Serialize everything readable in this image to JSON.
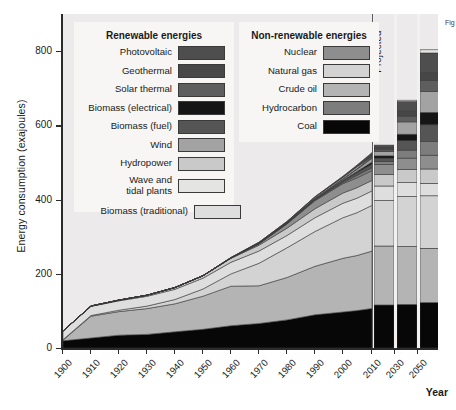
{
  "figure": {
    "y_axis_title": "Energy consumption (exajoules)",
    "x_axis_title": "Year",
    "projected_label": "Projected",
    "caption_fragment": "Fig"
  },
  "legends": [
    {
      "id": "renewable",
      "title": "Renewable energies",
      "items": [
        {
          "label": "Photovoltaic",
          "color": "#4e4e4e"
        },
        {
          "label": "Geothermal",
          "color": "#474747"
        },
        {
          "label": "Solar thermal",
          "color": "#5e5e5e"
        },
        {
          "label": "Biomass (electrical)",
          "color": "#151515"
        },
        {
          "label": "Biomass (fuel)",
          "color": "#555555"
        },
        {
          "label": "Wind",
          "color": "#a3a3a3"
        },
        {
          "label": "Hydropower",
          "color": "#c9c9c9"
        },
        {
          "label": "Wave and\ntidal plants",
          "color": "#e4e4e2"
        },
        {
          "label": "Biomass (traditional)",
          "color": "#dedede"
        }
      ]
    },
    {
      "id": "nonrenewable",
      "title": "Non-renewable energies",
      "items": [
        {
          "label": "Nuclear",
          "color": "#8e8e8e"
        },
        {
          "label": "Natural gas",
          "color": "#d3d3d3"
        },
        {
          "label": "Crude oil",
          "color": "#b4b4b4"
        },
        {
          "label": "Hydrocarbon",
          "color": "#7d7d7d"
        },
        {
          "label": "Coal",
          "color": "#070707"
        }
      ]
    }
  ],
  "chart_data": {
    "type": "area",
    "title": "",
    "xlabel": "Year",
    "ylabel": "Energy consumption (exajoules)",
    "xlim": [
      1900,
      2055
    ],
    "ylim": [
      0,
      900
    ],
    "yticks": [
      0,
      200,
      400,
      600,
      800
    ],
    "xticks": [
      1900,
      1910,
      1920,
      1930,
      1940,
      1950,
      1960,
      1970,
      1980,
      1990,
      2000,
      2010,
      2030,
      2050
    ],
    "grid": false,
    "legend_position": "inside-top",
    "annotations": [
      {
        "text": "Projected",
        "x": 2005,
        "orientation": "vertical"
      }
    ],
    "historic_x": [
      1900,
      1910,
      1920,
      1930,
      1940,
      1950,
      1960,
      1970,
      1980,
      1990,
      2000,
      2005
    ],
    "projected_x": [
      2010,
      2020,
      2030,
      2040,
      2050
    ],
    "stack_order_bottom_to_top": [
      "Coal",
      "Crude oil",
      "Natural gas",
      "Biomass (traditional)",
      "Hydropower",
      "Nuclear",
      "Hydrocarbon",
      "Biomass (fuel)",
      "Biomass (electrical)",
      "Wind",
      "Solar thermal",
      "Geothermal",
      "Photovoltaic",
      "Wave and tidal plants"
    ],
    "series": [
      {
        "name": "Coal",
        "color": "#070707",
        "values": [
          20,
          28,
          36,
          38,
          45,
          52,
          62,
          68,
          78,
          92,
          100,
          104,
          110,
          120,
          125,
          120,
          110
        ]
      },
      {
        "name": "Crude oil",
        "color": "#b4b4b4",
        "values": [
          2,
          5,
          10,
          16,
          22,
          36,
          62,
          110,
          128,
          134,
          148,
          152,
          158,
          160,
          150,
          130,
          105
        ]
      },
      {
        "name": "Natural gas",
        "color": "#d3d3d3",
        "values": [
          1,
          2,
          4,
          7,
          12,
          20,
          34,
          62,
          82,
          96,
          112,
          118,
          126,
          138,
          145,
          140,
          128
        ]
      },
      {
        "name": "Biomass (traditional)",
        "color": "#dedede",
        "values": [
          24,
          25,
          26,
          27,
          28,
          30,
          32,
          34,
          36,
          38,
          40,
          40,
          40,
          38,
          34,
          30,
          26
        ]
      },
      {
        "name": "Hydropower",
        "color": "#c9c9c9",
        "values": [
          0,
          1,
          2,
          3,
          5,
          7,
          11,
          16,
          20,
          24,
          28,
          29,
          31,
          36,
          40,
          44,
          48
        ]
      },
      {
        "name": "Nuclear",
        "color": "#8e8e8e",
        "values": [
          0,
          0,
          0,
          0,
          0,
          0,
          1,
          4,
          12,
          22,
          26,
          27,
          28,
          32,
          38,
          44,
          50
        ]
      },
      {
        "name": "Hydrocarbon",
        "color": "#7d7d7d",
        "values": [
          0,
          0,
          0,
          0,
          0,
          0,
          0,
          0,
          1,
          2,
          3,
          4,
          8,
          22,
          38,
          52,
          62
        ]
      },
      {
        "name": "Biomass (fuel)",
        "color": "#555555",
        "values": [
          0,
          0,
          0,
          0,
          0,
          0,
          0,
          0,
          1,
          2,
          4,
          5,
          10,
          26,
          46,
          66,
          86
        ]
      },
      {
        "name": "Biomass (electrical)",
        "color": "#151515",
        "values": [
          0,
          0,
          0,
          0,
          0,
          0,
          0,
          0,
          0,
          1,
          2,
          3,
          6,
          18,
          34,
          52,
          70
        ]
      },
      {
        "name": "Wind",
        "color": "#a3a3a3",
        "values": [
          0,
          0,
          0,
          0,
          0,
          0,
          0,
          0,
          0,
          1,
          3,
          5,
          12,
          34,
          58,
          82,
          104
        ]
      },
      {
        "name": "Solar thermal",
        "color": "#5e5e5e",
        "values": [
          0,
          0,
          0,
          0,
          0,
          0,
          0,
          0,
          0,
          0,
          1,
          2,
          5,
          16,
          30,
          46,
          60
        ]
      },
      {
        "name": "Geothermal",
        "color": "#474747",
        "values": [
          0,
          0,
          0,
          0,
          0,
          0,
          0,
          1,
          1,
          2,
          3,
          4,
          7,
          14,
          22,
          30,
          38
        ]
      },
      {
        "name": "Photovoltaic",
        "color": "#4e4e4e",
        "values": [
          0,
          0,
          0,
          0,
          0,
          0,
          0,
          0,
          0,
          0,
          1,
          2,
          6,
          26,
          54,
          86,
          118
        ]
      },
      {
        "name": "Wave and tidal plants",
        "color": "#e4e4e2",
        "values": [
          0,
          0,
          0,
          0,
          0,
          0,
          0,
          0,
          0,
          0,
          0,
          0,
          1,
          4,
          9,
          16,
          24
        ]
      }
    ],
    "totals_note": "Stacked total rises from about 47 exajoules in 1900 to roughly 880 exajoules in 2050"
  }
}
